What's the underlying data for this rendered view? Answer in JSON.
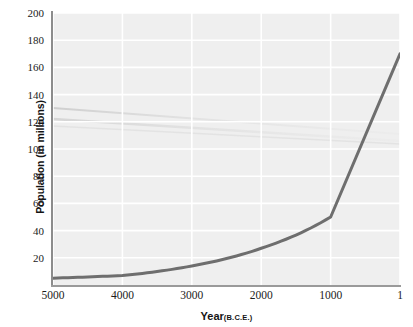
{
  "chart_data": {
    "type": "line",
    "title": "",
    "xlabel": "Year",
    "xlabel_unit": "(B.C.E.)",
    "ylabel": "Population (in millions)",
    "x": [
      5000,
      4000,
      3000,
      2000,
      1000,
      1
    ],
    "values": [
      5,
      7,
      14,
      27,
      50,
      170
    ],
    "series": [
      {
        "name": "World population",
        "values": [
          5,
          7,
          14,
          27,
          50,
          170
        ]
      }
    ],
    "xtick_labels": [
      "5000",
      "4000",
      "3000",
      "2000",
      "1000",
      "1"
    ],
    "ytick_labels": [
      "20",
      "40",
      "60",
      "80",
      "100",
      "120",
      "140",
      "160",
      "180",
      "200"
    ],
    "ytick_values": [
      20,
      40,
      60,
      80,
      100,
      120,
      140,
      160,
      180,
      200
    ],
    "xlim": [
      5000,
      1
    ],
    "ylim": [
      0,
      200
    ],
    "x_axis_inverted": true,
    "grid": true,
    "grid_color": "#ffffff",
    "legend": false,
    "legend_position": "none",
    "plot_background": "#efefef",
    "line_color": "#6e6e6e",
    "line_width": 3,
    "axis_color": "#8c8c8c",
    "text_color": "#141414"
  }
}
